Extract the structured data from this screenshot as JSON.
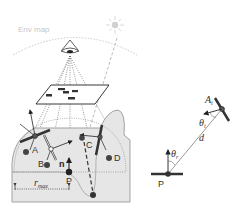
{
  "diagram": {
    "left_panel": {
      "env_map_label": "Env map",
      "sun_icon": "sun-icon",
      "eye_icon": "eye-icon",
      "points": [
        {
          "label": "A"
        },
        {
          "label": "B"
        },
        {
          "label": "C"
        },
        {
          "label": "D"
        },
        {
          "label": "P"
        }
      ],
      "normal_label": "n",
      "radius_label": "r",
      "radius_subscript": "max"
    },
    "right_panel": {
      "point_a_label": "A",
      "point_a_subscript": "i",
      "point_p_label": "P",
      "theta_i_label": "θ",
      "theta_i_subscript": "i",
      "theta_r_label": "θ",
      "theta_r_subscript": "r",
      "distance_label": "d"
    },
    "colors": {
      "terrain_fill": "#e6e6e6",
      "terrain_stroke": "#999999",
      "disk_color": "#333333",
      "sun_color": "#d0d0d0",
      "env_map_arc": "#bbbbbb"
    }
  }
}
